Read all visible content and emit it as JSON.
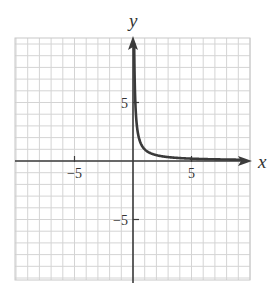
{
  "chart_data": {
    "type": "line",
    "title": "",
    "xlabel": "x",
    "ylabel": "y",
    "xlim": [
      -10,
      10
    ],
    "ylim": [
      -10,
      10
    ],
    "grid": true,
    "grid_step": 1,
    "x_ticks": [
      {
        "value": -5,
        "label": "−5"
      },
      {
        "value": 5,
        "label": "5"
      }
    ],
    "y_ticks": [
      {
        "value": 5,
        "label": "5"
      },
      {
        "value": -5,
        "label": "−5"
      }
    ],
    "series": [
      {
        "name": "y = 1/x (x > 0)",
        "function": "1/x",
        "domain": [
          0.1,
          10
        ],
        "x": [
          0.1,
          0.15,
          0.2,
          0.3,
          0.4,
          0.5,
          0.75,
          1,
          1.5,
          2,
          3,
          4,
          5,
          6,
          7,
          8,
          9,
          9.6
        ],
        "y": [
          10,
          6.67,
          5,
          3.33,
          2.5,
          2,
          1.33,
          1,
          0.67,
          0.5,
          0.33,
          0.25,
          0.2,
          0.17,
          0.14,
          0.125,
          0.11,
          0.104
        ]
      }
    ],
    "legend": null
  },
  "colors": {
    "grid": "#d4d4d4",
    "grid_border": "#c8c8c8",
    "axis": "#3c3c3c",
    "curve": "#3a3a3a",
    "text": "#333333"
  },
  "layout": {
    "plot_left": 15,
    "plot_top": 38,
    "plot_right": 250,
    "plot_bottom": 280,
    "origin_x": 133,
    "origin_y": 161,
    "unit_x": 11.7,
    "unit_y": 11.7
  }
}
